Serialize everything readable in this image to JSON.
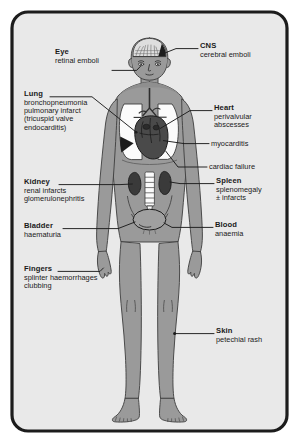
{
  "figure": {
    "border_color": "#1c1c1c",
    "background_color": "#e9e9e9",
    "body_fill": "#9a9a9a",
    "organ_dark": "#3a3a3a",
    "lung_fill": "#fbfbfb",
    "leader_color": "#1c1c1c",
    "text_color": "#1a1a1a"
  },
  "labels": {
    "cns": {
      "heading": "CNS",
      "lines": [
        "cerebral emboli"
      ]
    },
    "eye": {
      "heading": "Eye",
      "lines": [
        "retinal emboli"
      ]
    },
    "lung": {
      "heading": "Lung",
      "lines": [
        "bronchopneumonia",
        "pulmonary infarct",
        "(tricuspid valve",
        "endocarditis)"
      ]
    },
    "heart": {
      "heading": "Heart",
      "lines": [
        "perivalvular",
        "abscesses"
      ]
    },
    "myocarditis": {
      "heading": "",
      "lines": [
        "myocarditis"
      ]
    },
    "cardiac_failure": {
      "heading": "",
      "lines": [
        "cardiac failure"
      ]
    },
    "kidney": {
      "heading": "Kidney",
      "lines": [
        "renal infarcts",
        "glomerulonephritis"
      ]
    },
    "spleen": {
      "heading": "Spleen",
      "lines": [
        "splenomegaly",
        "± infarcts"
      ]
    },
    "bladder": {
      "heading": "Bladder",
      "lines": [
        "haematuria"
      ]
    },
    "blood": {
      "heading": "Blood",
      "lines": [
        "anaemia"
      ]
    },
    "fingers": {
      "heading": "Fingers",
      "lines": [
        "splinter haemorrhages",
        "clubbing"
      ]
    },
    "skin": {
      "heading": "Skin",
      "lines": [
        "petechial rash"
      ]
    }
  }
}
